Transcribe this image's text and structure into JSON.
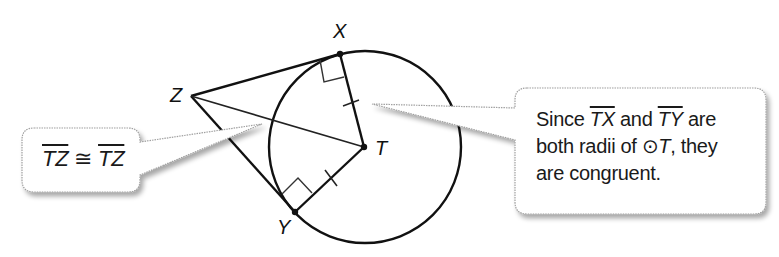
{
  "diagram": {
    "points": {
      "X": {
        "label": "X",
        "x": 340,
        "y": 54
      },
      "Y": {
        "label": "Y",
        "x": 295,
        "y": 212
      },
      "Z": {
        "label": "Z",
        "x": 191,
        "y": 96
      },
      "T": {
        "label": "T",
        "x": 364,
        "y": 147
      }
    },
    "circle": {
      "name": "T",
      "cx": 365,
      "cy": 147,
      "r": 96
    },
    "segments": [
      "ZX",
      "ZY",
      "ZT",
      "TX",
      "TY"
    ],
    "right_angles": [
      "at X",
      "at Y"
    ],
    "congruence_ticks": [
      "TX",
      "TY"
    ]
  },
  "callouts": {
    "left": {
      "seg1": "TZ",
      "symbol": "≅",
      "seg2": "TZ"
    },
    "right": {
      "w1": "Since ",
      "seg1": "TX",
      "w2": " and ",
      "seg2": "TY",
      "w3": " are",
      "line2a": "both radii of ",
      "circle_sym": "⊙",
      "circle_name": "T",
      "line2b": ", they",
      "line3": "are congruent."
    }
  },
  "colors": {
    "stroke": "#111111",
    "callout_border": "#9a9a9a",
    "callout_shadow": "#c8c8c8"
  }
}
